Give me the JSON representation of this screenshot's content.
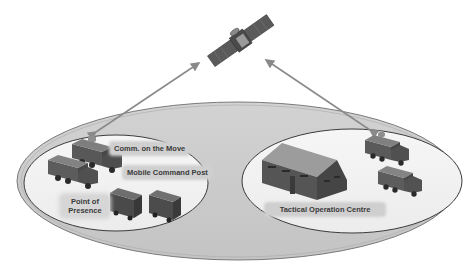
{
  "diagram": {
    "title": "",
    "colors": {
      "background": "#ffffff",
      "outer_ellipse_fill": "#cccccc",
      "outer_ellipse_stroke": "#7a7a7a",
      "inner_ellipse_fill": "#f2f2f2",
      "inner_ellipse_stroke": "#3c3c3c",
      "arrow": "#8a8a8a",
      "label_bg": "#cfcfcf",
      "label_text": "#3a3a3a"
    },
    "nodes": {
      "satellite": {
        "icon": "satellite-icon",
        "label": ""
      },
      "left_zone": {
        "labels": {
          "comm_on_the_move": "Comm. on the Move",
          "mobile_command_post": "Mobile Command Post",
          "point_of_presence": "Point of Presence"
        },
        "icons": [
          "truck-with-antenna-icon",
          "truck-icon",
          "van-icon",
          "van-icon"
        ]
      },
      "right_zone": {
        "labels": {
          "tactical_operation_centre": "Tactical Operation Centre"
        },
        "icons": [
          "tent-icon",
          "truck-with-antenna-icon",
          "truck-icon"
        ]
      }
    },
    "edges": [
      {
        "from": "left_zone",
        "to": "satellite",
        "style": "bidirectional-arrow"
      },
      {
        "from": "right_zone",
        "to": "satellite",
        "style": "bidirectional-arrow"
      }
    ]
  }
}
